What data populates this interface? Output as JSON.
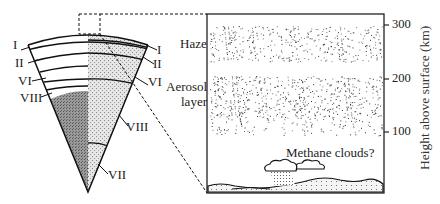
{
  "figure": {
    "left_labels": [
      "I",
      "II",
      "VI",
      "VIII"
    ],
    "right_labels": [
      "I",
      "II",
      "VI",
      "VIII",
      "VII"
    ],
    "panel": {
      "haze_label": "Haze",
      "aerosol_label_1": "Aerosol",
      "aerosol_label_2": "layer",
      "clouds_label": "Methane clouds?"
    },
    "axis": {
      "title": "Height above surface (km)",
      "ticks": [
        "300",
        "200",
        "100"
      ]
    }
  }
}
